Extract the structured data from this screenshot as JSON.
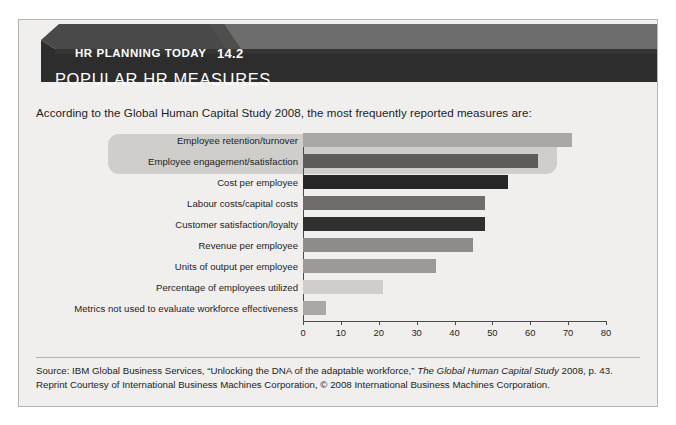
{
  "banner": {
    "eyebrow": "HR PLANNING TODAY",
    "number": "14.2",
    "title": "POPULAR HR MEASURES"
  },
  "intro": "According to the Global Human Capital Study 2008, the most frequently reported measures are:",
  "source": {
    "line1_prefix": "Source: IBM Global Business Services, “Unlocking the DNA of the adaptable workforce,” ",
    "line1_italic": "The Global Human Capital Study",
    "line1_suffix": " 2008, p. 43. Reprint Courtesy of International Business Machines Corporation, © 2008 International Business Machines Corporation."
  },
  "colors": {
    "frame_bg": "#f0efee",
    "banner_dark": "#2d2d2d",
    "banner_mid": "#494949",
    "banner_light": "#6d6d6d",
    "highlight": "#cfcecb",
    "axis": "#4a4a4a",
    "text": "#1d1d1d"
  },
  "chart_data": {
    "type": "bar",
    "orientation": "horizontal",
    "title": "POPULAR HR MEASURES",
    "xlabel": "",
    "ylabel": "",
    "xlim": [
      0,
      80
    ],
    "grid": false,
    "legend": null,
    "ticks": [
      "0",
      "10",
      "20",
      "30",
      "40",
      "50",
      "60",
      "70",
      "80"
    ],
    "tick_values": [
      0,
      10,
      20,
      30,
      40,
      50,
      60,
      70,
      80
    ],
    "categories": [
      "Employee retention/turnover",
      "Employee engagement/satisfaction",
      "Cost per employee",
      "Labour costs/capital costs",
      "Customer satisfaction/loyalty",
      "Revenue per employee",
      "Units of output per employee",
      "Percentage of employees utilized",
      "Metrics not used to evaluate workforce effectiveness"
    ],
    "values": [
      71,
      62,
      54,
      48,
      48,
      45,
      35,
      21,
      6
    ],
    "bar_colors": [
      "#a9a8a5",
      "#5d5c5a",
      "#262626",
      "#6e6d6a",
      "#2f2f2f",
      "#8d8c89",
      "#9b9a97",
      "#cfcecb",
      "#a9a8a6"
    ],
    "highlighted_categories": [
      "Employee retention/turnover",
      "Employee engagement/satisfaction"
    ],
    "annotations": [
      "According to the Global Human Capital Study 2008, the most frequently reported measures are:"
    ]
  }
}
